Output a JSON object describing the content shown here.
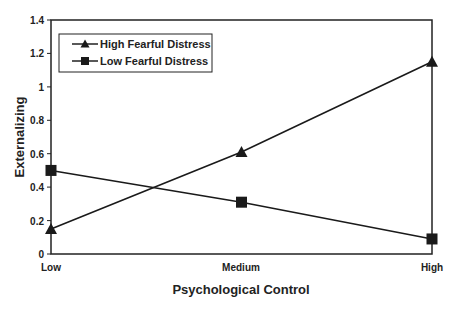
{
  "chart_data": {
    "type": "line",
    "title": "",
    "xlabel": "Psychological Control",
    "ylabel": "Externalizing",
    "categories": [
      "Low",
      "Medium",
      "High"
    ],
    "series": [
      {
        "name": "High Fearful Distress",
        "marker": "triangle",
        "values": [
          0.15,
          0.61,
          1.15
        ]
      },
      {
        "name": "Low Fearful Distress",
        "marker": "square",
        "values": [
          0.5,
          0.31,
          0.09
        ]
      }
    ],
    "ylim": [
      0,
      1.4
    ],
    "yticks": [
      "0",
      "0.2",
      "0.4",
      "0.6",
      "0.8",
      "1",
      "1.2",
      "1.4"
    ],
    "grid": false,
    "legend_position": "upper-left-inside"
  },
  "colors": {
    "line": "#1a1a1a",
    "background": "#ffffff"
  }
}
